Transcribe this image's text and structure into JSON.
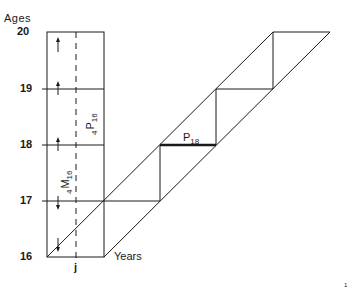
{
  "diagram": {
    "y_axis_title": "Ages",
    "x_axis_title": "Years",
    "x_marker": "j",
    "age_ticks": [
      "20",
      "19",
      "18",
      "17",
      "16"
    ],
    "labels": {
      "p16_prefix": "4",
      "p16_main": "P",
      "p16_sub": "16",
      "m16_prefix": "4",
      "m16_main": "M",
      "m16_sub": "16",
      "p18_main": "P",
      "p18_sub": "18"
    },
    "page_mark": "1",
    "colors": {
      "line": "#1a1a1a",
      "background": "#ffffff"
    }
  }
}
